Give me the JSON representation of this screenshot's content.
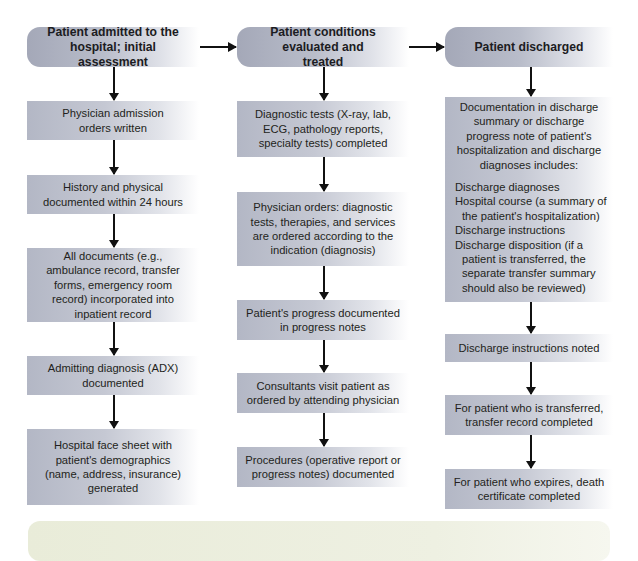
{
  "columns": [
    {
      "header": "Patient admitted to the hospital; initial assessment",
      "steps": [
        "Physician admission orders written",
        "History and physical documented within 24 hours",
        "All documents (e.g., ambulance record, transfer forms, emergency room record) incorporated into inpatient record",
        "Admitting diagnosis (ADX) documented",
        "Hospital face sheet with patient's demographics (name, address, insurance) generated"
      ]
    },
    {
      "header": "Patient conditions evaluated and treated",
      "steps": [
        "Diagnostic tests (X-ray, lab, ECG, pathology reports, specialty tests) completed",
        "Physician orders: diagnostic tests, therapies, and services are ordered according to the indication (diagnosis)",
        "Patient's progress documented in progress notes",
        "Consultants visit patient as ordered by attending physician",
        "Procedures (operative report or progress notes) documented"
      ]
    },
    {
      "header": "Patient discharged",
      "steps": [
        {
          "intro": "Documentation in discharge summary or discharge progress note of patient's hospitalization and discharge diagnoses includes:",
          "items": [
            "Discharge diagnoses",
            "Hospital course (a summary of the patient's hospitalization)",
            "Discharge instructions",
            "Discharge disposition (if a patient is transferred, the separate transfer summary should also be reviewed)"
          ]
        },
        "Discharge instructions noted",
        "For patient who is transferred, transfer record completed",
        "For patient who expires, death certificate completed"
      ]
    }
  ],
  "colors": {
    "header_fill": "#a4a8b8",
    "step_fill": "#b3b7c5",
    "arrow": "#111111",
    "footer_panel": "#e9ecd9"
  }
}
